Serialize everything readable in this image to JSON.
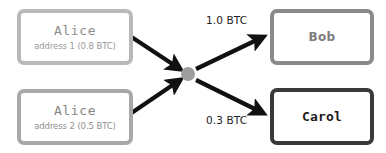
{
  "diagram": {
    "colors": {
      "arrow": "#111111",
      "hub": "#9e9e9e",
      "border_light": "#b9b9b9",
      "border_medium": "#8a8a8a",
      "border_dark": "#3a3a3a",
      "text_gray": "#8c8c8c",
      "text_dark": "#1c1c1c"
    },
    "inputs": [
      {
        "id": "alice-address-1",
        "title": "Alice",
        "subtitle": "address 1 (0.8 BTC)",
        "amount": "0.8 BTC",
        "address_label": "address 1"
      },
      {
        "id": "alice-address-2",
        "title": "Alice",
        "subtitle": "address 2 (0.5 BTC)",
        "amount": "0.5 BTC",
        "address_label": "address 2"
      }
    ],
    "outputs": [
      {
        "id": "bob",
        "title": "Bob",
        "amount_label": "1.0 BTC"
      },
      {
        "id": "carol",
        "title": "Carol",
        "amount_label": "0.3 BTC"
      }
    ],
    "hub": {
      "icon": "transaction-node-circle"
    },
    "edges": [
      {
        "from": "alice-address-1",
        "to": "hub",
        "label": ""
      },
      {
        "from": "alice-address-2",
        "to": "hub",
        "label": ""
      },
      {
        "from": "hub",
        "to": "bob",
        "label": "1.0 BTC"
      },
      {
        "from": "hub",
        "to": "carol",
        "label": "0.3 BTC"
      }
    ]
  }
}
